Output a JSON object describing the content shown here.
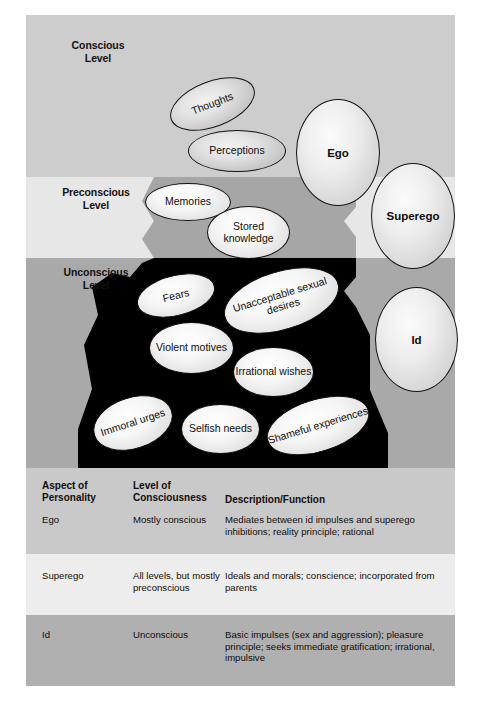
{
  "figure": {
    "levels": [
      {
        "id": "conscious",
        "label_line1": "Conscious",
        "label_line2": "Level",
        "color": "#cdcdcd"
      },
      {
        "id": "preconscious",
        "label_line1": "Preconscious",
        "label_line2": "Level",
        "color": "#e7e7e7"
      },
      {
        "id": "unconscious",
        "label_line1": "Unconscious",
        "label_line2": "Level",
        "color": "#a9a9a9"
      }
    ],
    "content_bubbles": [
      {
        "id": "thoughts",
        "label": "Thoughts",
        "level": "conscious"
      },
      {
        "id": "perceptions",
        "label": "Perceptions",
        "level": "conscious"
      },
      {
        "id": "memories",
        "label": "Memories",
        "level": "preconscious"
      },
      {
        "id": "stored-knowledge",
        "label": "Stored knowledge",
        "level": "preconscious"
      },
      {
        "id": "fears",
        "label": "Fears",
        "level": "unconscious"
      },
      {
        "id": "unacceptable-sexual-desires",
        "label": "Unacceptable sexual desires",
        "level": "unconscious"
      },
      {
        "id": "violent-motives",
        "label": "Violent motives",
        "level": "unconscious"
      },
      {
        "id": "irrational-wishes",
        "label": "Irrational wishes",
        "level": "unconscious"
      },
      {
        "id": "immoral-urges",
        "label": "Immoral urges",
        "level": "unconscious"
      },
      {
        "id": "selfish-needs",
        "label": "Selfish needs",
        "level": "unconscious"
      },
      {
        "id": "shameful-experiences",
        "label": "Shameful experiences",
        "level": "unconscious"
      }
    ],
    "structure_bubbles": [
      {
        "id": "ego",
        "label": "Ego"
      },
      {
        "id": "superego",
        "label": "Superego"
      },
      {
        "id": "id",
        "label": "Id"
      }
    ],
    "iceberg_color_conscious": "#cdcdcd",
    "iceberg_color_preconscious": "#a6a6a6",
    "iceberg_color_unconscious": "#000000"
  },
  "table": {
    "headers": {
      "col1_line1": "Aspect of",
      "col1_line2": "Personality",
      "col2_line1": "Level of",
      "col2_line2": "Consciousness",
      "col3": "Description/Function"
    },
    "rows": [
      {
        "aspect": "Ego",
        "level": "Mostly conscious",
        "description": "Mediates between id impulses and superego inhibitions; reality principle; rational"
      },
      {
        "aspect": "Superego",
        "level": "All levels, but mostly preconscious",
        "description": "Ideals and morals; conscience; incorporated from parents"
      },
      {
        "aspect": "Id",
        "level": "Unconscious",
        "description": "Basic impulses (sex and aggression); pleasure principle; seeks immediate gratification; irrational, impulsive"
      }
    ]
  }
}
